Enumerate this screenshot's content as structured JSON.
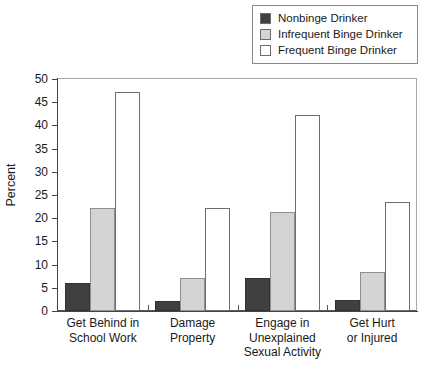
{
  "chart_data": {
    "type": "bar",
    "title": "",
    "subtitle": "",
    "xlabel": "",
    "ylabel": "Percent",
    "ylim": [
      0,
      50
    ],
    "ytick_step": 5,
    "yticks": [
      0,
      5,
      10,
      15,
      20,
      25,
      30,
      35,
      40,
      45,
      50
    ],
    "grid": false,
    "legend_position": "top-right",
    "categories": [
      "Get Behind in\nSchool Work",
      "Damage\nProperty",
      "Engage in\nUnexplained\nSexual Activity",
      "Get Hurt\nor Injured"
    ],
    "series": [
      {
        "name": "Nonbinge Drinker",
        "color": "#404040",
        "values": [
          6.0,
          2.1,
          7.2,
          2.3
        ]
      },
      {
        "name": "Infrequent Binge Drinker",
        "color": "#d4d4d4",
        "values": [
          22.1,
          7.2,
          21.4,
          8.5
        ]
      },
      {
        "name": "Frequent Binge Drinker",
        "color": "#ffffff",
        "values": [
          47.2,
          22.3,
          42.2,
          23.4
        ]
      }
    ]
  },
  "legend": {
    "items": [
      {
        "label": "Nonbinge Drinker",
        "color": "#404040"
      },
      {
        "label": "Infrequent Binge Drinker",
        "color": "#d4d4d4"
      },
      {
        "label": "Frequent Binge Drinker",
        "color": "#ffffff"
      }
    ]
  },
  "axes": {
    "y_label": "Percent",
    "y_tick_labels": [
      "0",
      "5",
      "10",
      "15",
      "20",
      "25",
      "30",
      "35",
      "40",
      "45",
      "50"
    ],
    "x_tick_labels": [
      "Get Behind in\nSchool Work",
      "Damage\nProperty",
      "Engage in\nUnexplained\nSexual Activity",
      "Get Hurt\nor Injured"
    ]
  }
}
